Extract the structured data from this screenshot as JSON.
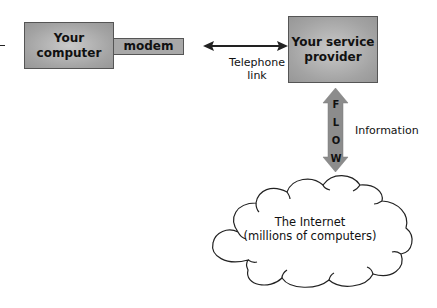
{
  "diagram": {
    "nodes": {
      "computer": {
        "label_line1": "Your",
        "label_line2": "computer"
      },
      "modem": {
        "label": "modem"
      },
      "provider": {
        "label_line1": "Your service",
        "label_line2": "provider"
      },
      "internet": {
        "label_line1": "The Internet",
        "label_line2": "(millions of computers)"
      }
    },
    "edges": {
      "telephone": {
        "label_line1": "Telephone",
        "label_line2": "link",
        "direction": "bidirectional"
      },
      "flow": {
        "letters": [
          "F",
          "L",
          "O",
          "W"
        ],
        "label": "Information",
        "direction": "bidirectional"
      }
    },
    "colors": {
      "box_fill": "#a3a3a3",
      "arrow_fill": "#8c8c8c",
      "line": "#222222"
    }
  }
}
